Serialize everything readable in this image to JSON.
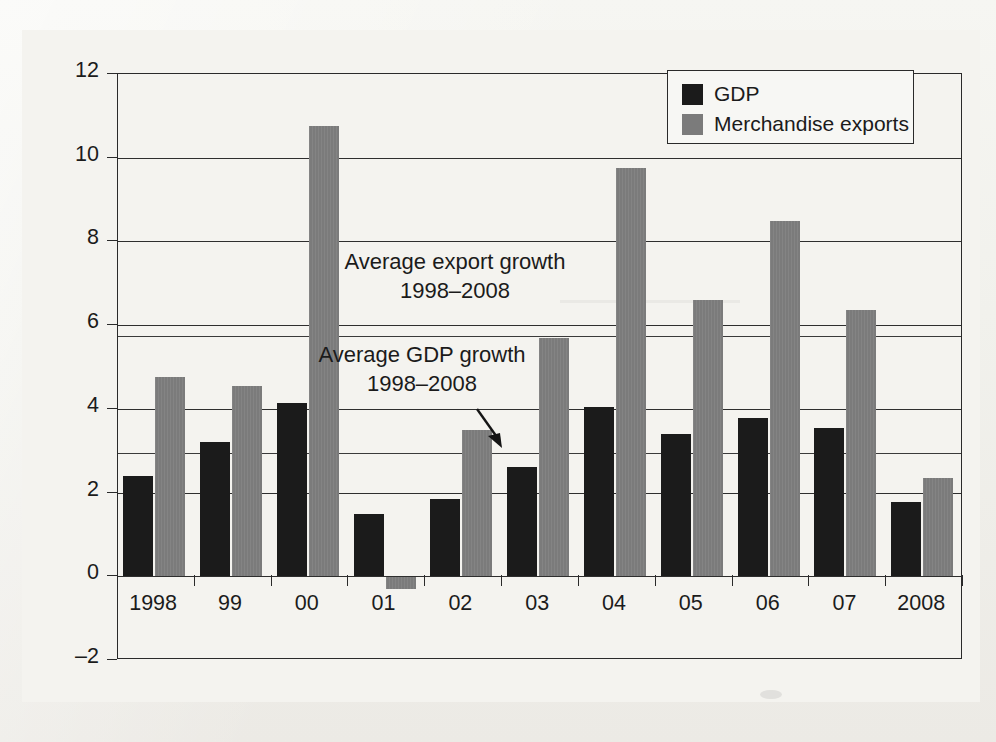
{
  "figure": {
    "background_color": "#f2f1ed",
    "plot_border_color": "#2a2a2a"
  },
  "legend": {
    "position": "top-right",
    "entries": [
      {
        "label": "GDP",
        "color": "#1b1b1b",
        "swatch": "legend-swatch-gdp"
      },
      {
        "label": "Merchandise exports",
        "color": "#7b7b7b",
        "swatch": "legend-swatch-exports"
      }
    ]
  },
  "annotations": [
    {
      "name": "avg-export-growth-note",
      "line1": "Average export growth",
      "line2": "1998–2008",
      "value": 5.75
    },
    {
      "name": "avg-gdp-growth-note",
      "line1": "Average GDP growth",
      "line2": "1998–2008",
      "value": 2.95
    }
  ],
  "axis": {
    "y_ticks": [
      "12",
      "10",
      "8",
      "6",
      "4",
      "2",
      "0",
      "–2"
    ],
    "y_tick_values": [
      12,
      10,
      8,
      6,
      4,
      2,
      0,
      -2
    ],
    "x_labels": [
      "1998",
      "99",
      "00",
      "01",
      "02",
      "03",
      "04",
      "05",
      "06",
      "07",
      "2008"
    ]
  },
  "chart_data": {
    "type": "bar",
    "title": "",
    "xlabel": "",
    "ylabel": "",
    "ylim": [
      -2,
      12
    ],
    "yticks": [
      -2,
      0,
      2,
      4,
      6,
      8,
      10,
      12
    ],
    "grid": true,
    "legend_position": "top-right",
    "categories": [
      "1998",
      "99",
      "00",
      "01",
      "02",
      "03",
      "04",
      "05",
      "06",
      "07",
      "2008"
    ],
    "series": [
      {
        "name": "GDP",
        "color": "#1b1b1b",
        "values": [
          2.4,
          3.2,
          4.15,
          1.5,
          1.85,
          2.6,
          4.05,
          3.4,
          3.78,
          3.55,
          1.78
        ]
      },
      {
        "name": "Merchandise exports",
        "color": "#7b7b7b",
        "values": [
          4.75,
          4.55,
          10.75,
          -0.3,
          3.5,
          5.7,
          9.75,
          6.6,
          8.5,
          6.35,
          2.35
        ]
      }
    ],
    "reference_lines": [
      {
        "label": "Average export growth 1998–2008",
        "value": 5.75
      },
      {
        "label": "Average GDP growth 1998–2008",
        "value": 2.95
      }
    ]
  }
}
